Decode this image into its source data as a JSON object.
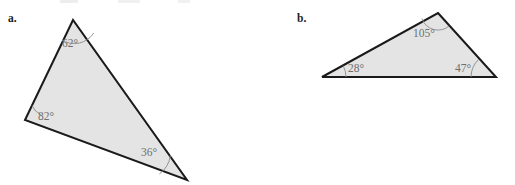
{
  "page": {
    "background_color": "#ffffff",
    "width": 515,
    "height": 185
  },
  "style": {
    "triangle_fill": "#e4e4e4",
    "triangle_stroke": "#1a1a1a",
    "triangle_stroke_width": 2,
    "angle_label_color": "#6f6f6f",
    "part_label_color": "#1c1c1c",
    "arc_color": "#8a8a8a"
  },
  "figures": [
    {
      "id": "figure-a",
      "part_label": "a.",
      "part_label_pos": {
        "x": 8,
        "y": 22
      },
      "vertices": [
        {
          "name": "apex",
          "x": 73,
          "y": 20
        },
        {
          "name": "left",
          "x": 25,
          "y": 120
        },
        {
          "name": "bottom-right",
          "x": 187,
          "y": 180
        }
      ],
      "polygon_points": "73,20 25,120 187,180",
      "angles": [
        {
          "name": "angle-apex",
          "value": "62°",
          "label_pos": {
            "x": 62,
            "y": 47
          },
          "vertex": {
            "x": 73,
            "y": 20
          },
          "arc_radius": 23
        },
        {
          "name": "angle-left",
          "value": "82°",
          "label_pos": {
            "x": 38,
            "y": 120
          },
          "vertex": {
            "x": 25,
            "y": 120
          },
          "arc_radius": 16
        },
        {
          "name": "angle-bottom-right",
          "value": "36°",
          "label_pos": {
            "x": 141,
            "y": 156
          },
          "vertex": {
            "x": 187,
            "y": 180
          },
          "arc_radius": 28
        }
      ]
    },
    {
      "id": "figure-b",
      "part_label": "b.",
      "part_label_pos": {
        "x": 297,
        "y": 22
      },
      "vertices": [
        {
          "name": "top",
          "x": 438,
          "y": 13
        },
        {
          "name": "right",
          "x": 496,
          "y": 77
        },
        {
          "name": "left",
          "x": 322,
          "y": 77
        }
      ],
      "polygon_points": "438,13 496,77 322,77",
      "angles": [
        {
          "name": "angle-top",
          "value": "105°",
          "label_pos": {
            "x": 413,
            "y": 37
          },
          "vertex": {
            "x": 438,
            "y": 13
          },
          "arc_radius": 17
        },
        {
          "name": "angle-left",
          "value": "28°",
          "label_pos": {
            "x": 348,
            "y": 72
          },
          "vertex": {
            "x": 322,
            "y": 77
          },
          "arc_radius": 24
        },
        {
          "name": "angle-right",
          "value": "47°",
          "label_pos": {
            "x": 455,
            "y": 72
          },
          "vertex": {
            "x": 496,
            "y": 77
          },
          "arc_radius": 25
        }
      ]
    }
  ]
}
